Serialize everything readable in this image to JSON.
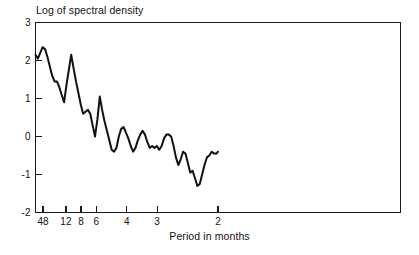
{
  "chart_data": {
    "type": "line",
    "title": "",
    "ylabel": "Log of spectral density",
    "xlabel": "Period in months",
    "grid": false,
    "legend": "none",
    "ylim": [
      -2,
      3
    ],
    "yticks": [
      -2,
      -1,
      0,
      1,
      2,
      3
    ],
    "ytick_labels": [
      "-2",
      "-1",
      "0",
      "1",
      "2",
      "3"
    ],
    "xlim": [
      0,
      1
    ],
    "xticks": [
      0.0208,
      0.0833,
      0.125,
      0.1667,
      0.25,
      0.3333,
      0.5
    ],
    "xtick_labels": [
      "48",
      "12",
      "8",
      "6",
      "4",
      "3",
      "2"
    ],
    "xtick_note": "axis is frequency; labels are period in months",
    "xaxis_units": "cycles per month",
    "series": [
      {
        "name": "log spectral density",
        "x": [
          0.0,
          0.0065,
          0.013,
          0.0196,
          0.0261,
          0.0326,
          0.0391,
          0.0457,
          0.0522,
          0.0587,
          0.0652,
          0.0717,
          0.0783,
          0.0848,
          0.0913,
          0.0978,
          0.1043,
          0.1109,
          0.1174,
          0.1239,
          0.1304,
          0.137,
          0.1435,
          0.15,
          0.1565,
          0.163,
          0.1696,
          0.1761,
          0.1826,
          0.1891,
          0.1957,
          0.2022,
          0.2087,
          0.2152,
          0.2217,
          0.2283,
          0.2348,
          0.2413,
          0.2478,
          0.2543,
          0.2609,
          0.2674,
          0.2739,
          0.2804,
          0.287,
          0.2935,
          0.3,
          0.3065,
          0.313,
          0.3196,
          0.3261,
          0.3326,
          0.3391,
          0.3457,
          0.3522,
          0.3587,
          0.3652,
          0.3717,
          0.3783,
          0.3848,
          0.3913,
          0.3978,
          0.4043,
          0.4109,
          0.4174,
          0.4239,
          0.4304,
          0.437,
          0.4435,
          0.45,
          0.4565,
          0.463,
          0.4696,
          0.4761,
          0.4826,
          0.4891,
          0.4957,
          0.5
        ],
        "y": [
          2.15,
          2.05,
          2.2,
          2.35,
          2.3,
          2.1,
          1.85,
          1.6,
          1.45,
          1.45,
          1.3,
          1.1,
          0.9,
          1.35,
          1.75,
          2.15,
          1.8,
          1.45,
          1.15,
          0.85,
          0.6,
          0.65,
          0.7,
          0.6,
          0.3,
          0.0,
          0.45,
          1.05,
          0.7,
          0.4,
          0.15,
          -0.1,
          -0.35,
          -0.4,
          -0.3,
          0.0,
          0.2,
          0.25,
          0.1,
          -0.05,
          -0.25,
          -0.4,
          -0.3,
          -0.1,
          0.05,
          0.15,
          0.05,
          -0.15,
          -0.3,
          -0.25,
          -0.3,
          -0.25,
          -0.35,
          -0.25,
          -0.05,
          0.05,
          0.05,
          0.0,
          -0.25,
          -0.55,
          -0.75,
          -0.6,
          -0.4,
          -0.45,
          -0.7,
          -0.95,
          -0.9,
          -1.1,
          -1.3,
          -1.25,
          -1.0,
          -0.75,
          -0.55,
          -0.5,
          -0.4,
          -0.45,
          -0.45,
          -0.4
        ]
      }
    ]
  },
  "axes": {
    "y_axis_title": "Log of spectral density",
    "x_axis_title": "Period in months"
  },
  "style": {
    "line_color": "#111111",
    "axis_color": "#1a1a1a",
    "background": "#ffffff"
  }
}
